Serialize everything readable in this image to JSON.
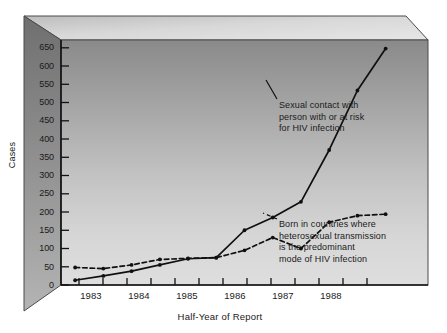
{
  "figure": {
    "background": "#ffffff",
    "plot_fill_top": "#8d8d8d",
    "plot_fill_bottom": "#dcdcdc",
    "side_panel_color": "#7a7a7a",
    "top_panel_color": "#cfcfcf",
    "line_color": "#101010"
  },
  "chart_data": {
    "type": "line",
    "title": "",
    "subtitle": "",
    "xlabel": "Half-Year of Report",
    "ylabel": "Cases",
    "xlim": [
      1982.5,
      1989.0
    ],
    "ylim": [
      0,
      680
    ],
    "yticks": [
      0,
      50,
      100,
      150,
      200,
      250,
      300,
      350,
      400,
      450,
      500,
      550,
      600,
      650
    ],
    "ytick_labels": [
      "0",
      "50",
      "100",
      "150",
      "200",
      "250",
      "300",
      "350",
      "400",
      "450",
      "500",
      "550",
      "600",
      "650"
    ],
    "xticks": [
      1982.75,
      1983.25,
      1983.75,
      1984.25,
      1984.75,
      1985.25,
      1985.75,
      1986.25,
      1986.75,
      1987.25,
      1987.75,
      1988.25,
      1988.75
    ],
    "xtick_labels": [
      "1983",
      "1984",
      "1985",
      "1986",
      "1987",
      "1988"
    ],
    "xtick_label_positions": [
      1983.0,
      1984.0,
      1985.0,
      1986.0,
      1987.0,
      1988.0
    ],
    "grid": false,
    "legend_position": "annotations-inline",
    "x": [
      1982.75,
      1983.25,
      1983.75,
      1984.25,
      1984.75,
      1985.25,
      1985.75,
      1986.25,
      1986.75,
      1987.25,
      1987.75,
      1988.25
    ],
    "series": [
      {
        "name": "Sexual contact with person with or at risk for HIV infection",
        "style": "solid",
        "marker": "dot",
        "values": [
          13,
          25,
          38,
          55,
          72,
          75,
          150,
          185,
          228,
          370,
          533,
          648
        ]
      },
      {
        "name": "Born in countries where heterosexual transmission is the predominant mode of HIV infection",
        "style": "dashed",
        "marker": "dot",
        "values": [
          48,
          45,
          55,
          70,
          73,
          75,
          95,
          130,
          100,
          172,
          190,
          194
        ]
      }
    ],
    "annotations": [
      {
        "id": "sexual-contact",
        "lines": [
          "Sexual contact with",
          "person with or at risk",
          "for HIV infection"
        ],
        "target_series": 0
      },
      {
        "id": "born-in-countries",
        "lines": [
          "Born in countries where",
          "heterosexual transmission",
          "is the predominant",
          "mode of HIV infection"
        ],
        "target_series": 1
      }
    ]
  }
}
